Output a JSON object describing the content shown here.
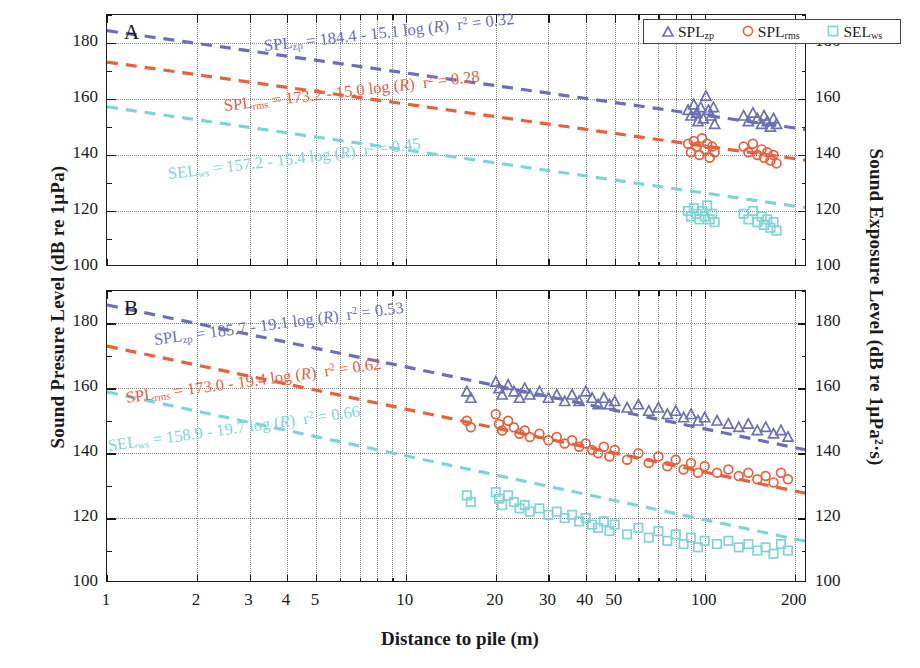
{
  "figure": {
    "xlabel": "Distance to pile (m)",
    "ylabel_left": "Sound Presure Level (dB re 1µPa)",
    "ylabel_right": "Sound Exposure Level (dB re 1µPa²·s)"
  },
  "legend": {
    "position": "top-right",
    "items": [
      {
        "marker": "triangle",
        "label": "SPL",
        "sub": "zp",
        "color": "#6b6fb5"
      },
      {
        "marker": "circle",
        "label": "SPL",
        "sub": "rms",
        "color": "#e8603c"
      },
      {
        "marker": "square",
        "label": "SEL",
        "sub": "ws",
        "color": "#7fd4d6"
      }
    ]
  },
  "colors": {
    "spl_zp": "#6b6fb5",
    "spl_rms": "#e8603c",
    "sel_ws": "#7fd4d6",
    "axis": "#1a1a1a",
    "grid": "#6f6f6f"
  },
  "panels": [
    {
      "id": "A",
      "letter": "A",
      "y_ticks": [
        100,
        120,
        140,
        160,
        180
      ],
      "ylim": [
        100,
        190
      ],
      "equations": [
        {
          "series": "SPL",
          "sub": "zp",
          "intercept": "184.4",
          "slope": "15.1",
          "r2": "0.32",
          "text": "SPL_zp = 184.4 - 15.1 log (R)   r² = 0.32",
          "color": "#6b6fb5"
        },
        {
          "series": "SPL",
          "sub": "rms",
          "intercept": "173.2",
          "slope": "15.0",
          "r2": "0.28",
          "text": "SPL_rms = 173.2 - 15.0 log (R)   r² = 0.28",
          "color": "#e8603c"
        },
        {
          "series": "SEL",
          "sub": "ws",
          "intercept": "157.2",
          "slope": "15.4",
          "r2": "0.45",
          "text": "SEL_ws = 157.2 - 15.4 log (R)   r² = 0.45",
          "color": "#7fd4d6"
        }
      ]
    },
    {
      "id": "B",
      "letter": "B",
      "y_ticks": [
        100,
        120,
        140,
        160,
        180
      ],
      "ylim": [
        100,
        190
      ],
      "equations": [
        {
          "series": "SPL",
          "sub": "zp",
          "intercept": "185.7",
          "slope": "19.1",
          "r2": "0.53",
          "text": "SPL_zp = 185.7 - 19.1 log (R)   r² = 0.53",
          "color": "#6b6fb5"
        },
        {
          "series": "SPL",
          "sub": "rms",
          "intercept": "173.0",
          "slope": "19.4",
          "r2": "0.62",
          "text": "SPL_rms = 173.0 - 19.4 log (R)   r² = 0.62",
          "color": "#e8603c"
        },
        {
          "series": "SEL",
          "sub": "ws",
          "intercept": "158.9",
          "slope": "19.7",
          "r2": "0.66",
          "text": "SEL_ws = 158.9 - 19.7 log (R)   r² = 0.66",
          "color": "#7fd4d6"
        }
      ]
    }
  ],
  "x_ticks": [
    {
      "value": 1,
      "label": "1"
    },
    {
      "value": 2,
      "label": "2"
    },
    {
      "value": 3,
      "label": "3"
    },
    {
      "value": 4,
      "label": "4"
    },
    {
      "value": 5,
      "label": "5"
    },
    {
      "value": 10,
      "label": "10"
    },
    {
      "value": 20,
      "label": "20"
    },
    {
      "value": 30,
      "label": "30"
    },
    {
      "value": 40,
      "label": "40"
    },
    {
      "value": 50,
      "label": "50"
    },
    {
      "value": 100,
      "label": "100"
    },
    {
      "value": 200,
      "label": "200"
    }
  ],
  "chart_data": {
    "type": "scatter",
    "title": "",
    "xlabel": "Distance to pile (m)",
    "ylabel": "Sound Presure Level (dB re 1µPa)",
    "ylabel_secondary": "Sound Exposure Level (dB re 1µPa²·s)",
    "xscale": "log",
    "xlim": [
      1,
      220
    ],
    "ylim": [
      100,
      190
    ],
    "grid": true,
    "legend_position": "upper right",
    "panels": [
      {
        "id": "A",
        "label": "A",
        "fits": [
          {
            "name": "SPL_zp",
            "intercept": 184.4,
            "slope": -15.1,
            "r2": 0.32,
            "color": "#6b6fb5",
            "style": "dashed"
          },
          {
            "name": "SPL_rms",
            "intercept": 173.2,
            "slope": -15.0,
            "r2": 0.28,
            "color": "#e8603c",
            "style": "dashed"
          },
          {
            "name": "SEL_ws",
            "intercept": 157.2,
            "slope": -15.4,
            "r2": 0.45,
            "color": "#7fd4d6",
            "style": "dashed"
          }
        ],
        "series": [
          {
            "name": "SPL_zp",
            "marker": "triangle",
            "color": "#6b6fb5",
            "points": [
              [
                88,
                156
              ],
              [
                90,
                154
              ],
              [
                92,
                158
              ],
              [
                94,
                155
              ],
              [
                95,
                152
              ],
              [
                97,
                157
              ],
              [
                99,
                153
              ],
              [
                101,
                161
              ],
              [
                103,
                156
              ],
              [
                105,
                154
              ],
              [
                107,
                157
              ],
              [
                108,
                151
              ],
              [
                135,
                154
              ],
              [
                140,
                152
              ],
              [
                145,
                155
              ],
              [
                150,
                153
              ],
              [
                155,
                151
              ],
              [
                158,
                154
              ],
              [
                162,
                152
              ],
              [
                166,
                150
              ],
              [
                170,
                153
              ],
              [
                174,
                151
              ]
            ]
          },
          {
            "name": "SPL_rms",
            "marker": "circle",
            "color": "#e8603c",
            "points": [
              [
                88,
                144
              ],
              [
                90,
                141
              ],
              [
                92,
                145
              ],
              [
                94,
                143
              ],
              [
                96,
                140
              ],
              [
                98,
                146
              ],
              [
                100,
                142
              ],
              [
                102,
                144
              ],
              [
                104,
                139
              ],
              [
                106,
                143
              ],
              [
                108,
                141
              ],
              [
                135,
                143
              ],
              [
                140,
                141
              ],
              [
                145,
                144
              ],
              [
                150,
                140
              ],
              [
                155,
                142
              ],
              [
                158,
                139
              ],
              [
                162,
                141
              ],
              [
                166,
                138
              ],
              [
                170,
                140
              ],
              [
                174,
                137
              ]
            ]
          },
          {
            "name": "SEL_ws",
            "marker": "square",
            "color": "#7fd4d6",
            "points": [
              [
                88,
                120
              ],
              [
                90,
                118
              ],
              [
                92,
                121
              ],
              [
                94,
                119
              ],
              [
                96,
                117
              ],
              [
                98,
                120
              ],
              [
                100,
                118
              ],
              [
                102,
                122
              ],
              [
                104,
                117
              ],
              [
                106,
                119
              ],
              [
                108,
                116
              ],
              [
                135,
                119
              ],
              [
                140,
                117
              ],
              [
                145,
                120
              ],
              [
                150,
                116
              ],
              [
                155,
                118
              ],
              [
                158,
                115
              ],
              [
                162,
                117
              ],
              [
                166,
                114
              ],
              [
                170,
                116
              ],
              [
                174,
                113
              ]
            ]
          }
        ]
      },
      {
        "id": "B",
        "label": "B",
        "fits": [
          {
            "name": "SPL_zp",
            "intercept": 185.7,
            "slope": -19.1,
            "r2": 0.53,
            "color": "#6b6fb5",
            "style": "dashed"
          },
          {
            "name": "SPL_rms",
            "intercept": 173.0,
            "slope": -19.4,
            "r2": 0.62,
            "color": "#e8603c",
            "style": "dashed"
          },
          {
            "name": "SEL_ws",
            "intercept": 158.9,
            "slope": -19.7,
            "r2": 0.66,
            "color": "#7fd4d6",
            "style": "dashed"
          }
        ],
        "series": [
          {
            "name": "SPL_zp",
            "marker": "triangle",
            "color": "#6b6fb5",
            "points": [
              [
                16,
                159
              ],
              [
                16.5,
                157
              ],
              [
                20,
                162
              ],
              [
                20.5,
                160
              ],
              [
                21,
                158
              ],
              [
                22,
                161
              ],
              [
                23,
                159
              ],
              [
                24,
                157
              ],
              [
                25,
                160
              ],
              [
                26,
                158
              ],
              [
                28,
                159
              ],
              [
                30,
                157
              ],
              [
                32,
                158
              ],
              [
                34,
                156
              ],
              [
                36,
                158
              ],
              [
                38,
                156
              ],
              [
                40,
                159
              ],
              [
                42,
                157
              ],
              [
                44,
                155
              ],
              [
                46,
                157
              ],
              [
                48,
                155
              ],
              [
                50,
                156
              ],
              [
                55,
                154
              ],
              [
                60,
                155
              ],
              [
                65,
                153
              ],
              [
                70,
                154
              ],
              [
                75,
                152
              ],
              [
                80,
                153
              ],
              [
                85,
                151
              ],
              [
                90,
                152
              ],
              [
                95,
                150
              ],
              [
                100,
                151
              ],
              [
                110,
                150
              ],
              [
                120,
                149
              ],
              [
                130,
                148
              ],
              [
                140,
                149
              ],
              [
                150,
                147
              ],
              [
                160,
                148
              ],
              [
                170,
                146
              ],
              [
                180,
                147
              ],
              [
                190,
                145
              ]
            ]
          },
          {
            "name": "SPL_rms",
            "marker": "circle",
            "color": "#e8603c",
            "points": [
              [
                16,
                150
              ],
              [
                16.5,
                148
              ],
              [
                20,
                152
              ],
              [
                20.5,
                149
              ],
              [
                21,
                147
              ],
              [
                22,
                150
              ],
              [
                23,
                148
              ],
              [
                24,
                146
              ],
              [
                25,
                147
              ],
              [
                26,
                145
              ],
              [
                28,
                146
              ],
              [
                30,
                144
              ],
              [
                32,
                145
              ],
              [
                34,
                143
              ],
              [
                36,
                144
              ],
              [
                38,
                142
              ],
              [
                40,
                143
              ],
              [
                42,
                141
              ],
              [
                44,
                140
              ],
              [
                46,
                142
              ],
              [
                48,
                139
              ],
              [
                50,
                141
              ],
              [
                55,
                138
              ],
              [
                60,
                140
              ],
              [
                65,
                137
              ],
              [
                70,
                139
              ],
              [
                75,
                136
              ],
              [
                80,
                138
              ],
              [
                85,
                135
              ],
              [
                90,
                137
              ],
              [
                95,
                134
              ],
              [
                100,
                136
              ],
              [
                110,
                134
              ],
              [
                120,
                135
              ],
              [
                130,
                133
              ],
              [
                140,
                134
              ],
              [
                150,
                132
              ],
              [
                160,
                133
              ],
              [
                170,
                131
              ],
              [
                180,
                134
              ],
              [
                190,
                132
              ]
            ]
          },
          {
            "name": "SEL_ws",
            "marker": "square",
            "color": "#7fd4d6",
            "points": [
              [
                16,
                127
              ],
              [
                16.5,
                125
              ],
              [
                20,
                128
              ],
              [
                20.5,
                126
              ],
              [
                21,
                124
              ],
              [
                22,
                127
              ],
              [
                23,
                125
              ],
              [
                24,
                123
              ],
              [
                25,
                124
              ],
              [
                26,
                122
              ],
              [
                28,
                123
              ],
              [
                30,
                121
              ],
              [
                32,
                122
              ],
              [
                34,
                120
              ],
              [
                36,
                121
              ],
              [
                38,
                119
              ],
              [
                40,
                120
              ],
              [
                42,
                118
              ],
              [
                44,
                117
              ],
              [
                46,
                119
              ],
              [
                48,
                116
              ],
              [
                50,
                118
              ],
              [
                55,
                115
              ],
              [
                60,
                117
              ],
              [
                65,
                114
              ],
              [
                70,
                116
              ],
              [
                75,
                113
              ],
              [
                80,
                115
              ],
              [
                85,
                112
              ],
              [
                90,
                114
              ],
              [
                95,
                111
              ],
              [
                100,
                113
              ],
              [
                110,
                112
              ],
              [
                120,
                113
              ],
              [
                130,
                111
              ],
              [
                140,
                112
              ],
              [
                150,
                110
              ],
              [
                160,
                111
              ],
              [
                170,
                109
              ],
              [
                180,
                112
              ],
              [
                190,
                110
              ]
            ]
          }
        ]
      }
    ]
  }
}
